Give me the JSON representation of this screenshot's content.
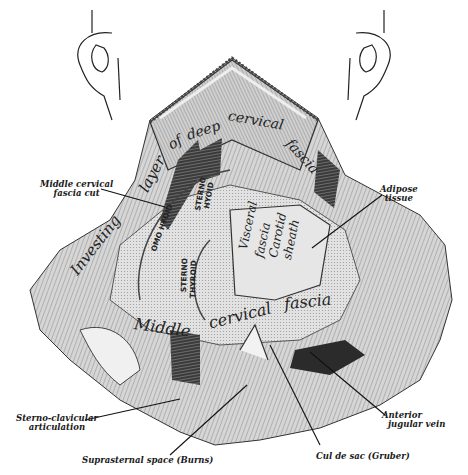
{
  "figure": {
    "regions": {
      "investing_layer": "Investing layer of deep cervical fascia",
      "investing_words": [
        "Investing",
        "layer",
        "of",
        "deep",
        "cervical",
        "fascia"
      ],
      "middle_fascia_words": [
        "Middle",
        "cervical",
        "fascia"
      ],
      "visceral": [
        "Visceral",
        "fascia"
      ],
      "carotid": [
        "Carotid",
        "sheath"
      ]
    },
    "muscles": {
      "omohyoid": "OMO HYOID",
      "sternohyoid": [
        "STERNO",
        "HYOID"
      ],
      "sternothyroid": [
        "STERNO",
        "THYROID"
      ]
    },
    "callouts": {
      "middle_cervical_fascia_cut": [
        "Middle cervical",
        "fascia cut"
      ],
      "adipose_tissue": [
        "Adipose",
        "tissue"
      ],
      "sterno_clavicular": [
        "Sterno-clavicular",
        "articulation"
      ],
      "suprasternal_space": "Suprasternal space (Burns)",
      "cul_de_sac": "Cul de sac (Gruber)",
      "anterior_jugular": [
        "Anterior",
        "jugular vein"
      ]
    },
    "colors": {
      "ink": "#1a1a1a",
      "tissue": "#c9c9c9",
      "tissue_dark": "#6f6f6f",
      "muscle_dark": "#2b2b2b",
      "paper": "#ffffff"
    }
  }
}
